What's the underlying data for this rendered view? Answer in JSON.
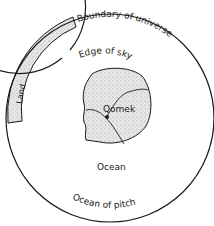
{
  "diagram": {
    "title": "",
    "labels": {
      "boundary": "Boundary of universe",
      "land": "Land",
      "sky": "Edge of sky",
      "center": "Qomek",
      "ocean": "Ocean",
      "pitch": "Ocean of pitch"
    },
    "colors": {
      "ink": "#1a1a1a",
      "stipple": "#d8d8d8",
      "background": "#ffffff"
    }
  }
}
